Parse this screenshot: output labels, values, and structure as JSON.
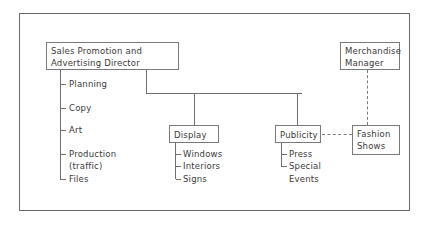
{
  "chart": {
    "director": {
      "line1": "Sales Promotion and",
      "line2": "Advertising Director"
    },
    "director_functions": [
      {
        "label": "Planning"
      },
      {
        "label": "Copy"
      },
      {
        "label": "Art"
      },
      {
        "label": "Production",
        "sub": "(traffic)"
      },
      {
        "label": "Files"
      }
    ],
    "merchandise_manager": {
      "line1": "Merchandise",
      "line2": "Manager"
    },
    "display": {
      "label": "Display",
      "items": [
        "Windows",
        "Interiors",
        "Signs"
      ]
    },
    "publicity": {
      "label": "Publicity",
      "items": [
        "Press",
        "Special",
        "Events"
      ]
    },
    "fashion_shows": {
      "line1": "Fashion",
      "line2": "Shows"
    }
  }
}
